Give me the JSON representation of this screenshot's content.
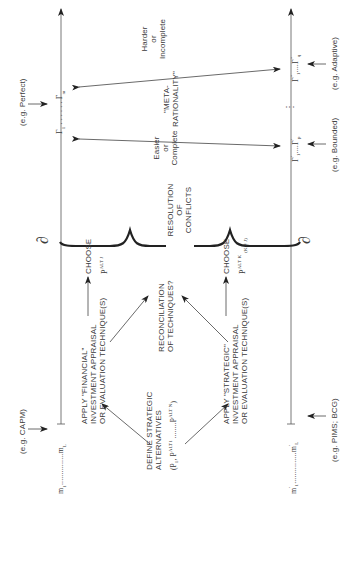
{
  "diagram": {
    "start": {
      "title": "DEFINE STRATEGIC ALTERNATIVES",
      "line1": "DEFINE STRATEGIC",
      "line2": "ALTERNATIVES",
      "set": "(P₁, P^ALT1 ........P^ALT N)",
      "set_a": "(P",
      "set_b": "1",
      "set_c": ", P",
      "set_d": "ALT1",
      "set_e": " ........P",
      "set_f": "ALT N",
      "set_g": ")"
    },
    "financial": {
      "line1": "APPLY \"FINANCIAL\"",
      "line2": "INVESTMENT APPRAISAL",
      "line3": "OR EVALUATION TECHNIQUE(S)"
    },
    "strategic": {
      "line1": "APPLY \"STRATEGIC\"",
      "line2": "INVESTMENT APPRAISAL",
      "line3": "OR EVALUATION TECHNIQUE(S)"
    },
    "reconciliation": {
      "line1": "RECONCILIATION",
      "line2": "OF TECHNIQUES?"
    },
    "choose_top": {
      "label": "CHOOSE",
      "p": "P",
      "sup": "ALT J"
    },
    "choose_bottom": {
      "label": "CHOOSE",
      "p": "P",
      "sup": "ALT K",
      "sub": "(K ≠ J)"
    },
    "resolution": {
      "line1": "RESOLUTION",
      "line2": "OF",
      "line3": "CONFLICTS"
    },
    "easier": {
      "line1": "Easier",
      "line2": "or",
      "line3": "Complete"
    },
    "harder": {
      "line1": "Harder",
      "line2": "or",
      "line3": "Incomplete"
    },
    "meta": {
      "line1": "\"META-",
      "line2": "RATIONALITY\""
    },
    "top_track": {
      "m_start": "m",
      "m_start_sub": "1",
      "dots": "...............",
      "m_end": "m",
      "m_end_sub": "L",
      "partial": "∂",
      "example": "(e.g. CAPM)"
    },
    "bottom_track": {
      "m_start": "m",
      "m_start_sup": "′",
      "m_start_sub": "1",
      "dots": "...............",
      "m_end": "m",
      "m_end_sup": "′",
      "m_end_sub": "L",
      "partial": "∂",
      "example": "(e.g. PIMS; BCG)"
    },
    "gamma_perfect": {
      "g1": "Γ",
      "g1_sub": "1",
      "dots": ". . . . . .",
      "gm": "Γ",
      "gm_sub": "m",
      "example": "(e.g. Perfect)"
    },
    "gamma_bounded": {
      "g1": "Γ",
      "g1_sup": "′",
      "g1_sub": "1",
      "dots": "....",
      "gp": "Γ",
      "gp_sup": "′",
      "gp_sub": "p",
      "example": "(e.g. Bounded)"
    },
    "gamma_vdots": "⋮",
    "gamma_adaptive": {
      "g1": "Γ",
      "g1_sup": "″",
      "g1_sub": "1",
      "dots": "....",
      "gq": "Γ",
      "gq_sup": "″",
      "gq_sub": "q",
      "example": "(e.g. Adaptive)"
    }
  }
}
